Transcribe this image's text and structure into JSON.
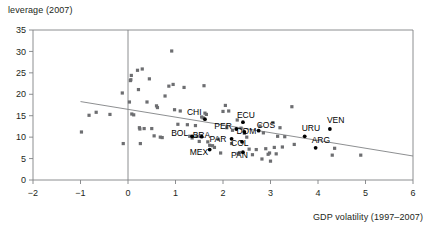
{
  "axes": {
    "ylabel": "leverage (2007)",
    "xlabel": "GDP volatility (1997–2007)",
    "yticks": [
      "0",
      "5",
      "10",
      "15",
      "20",
      "25",
      "30",
      "35"
    ],
    "xticks": [
      "−2",
      "−1",
      "0",
      "1",
      "2",
      "3",
      "4",
      "5",
      "6"
    ]
  },
  "colors": {
    "marker": "#6d6e71",
    "highlight": "#000000",
    "axis": "#808285",
    "trend": "#808285",
    "text": "#231f20",
    "background": "#ffffff"
  },
  "chart_data": {
    "type": "scatter",
    "title": "",
    "xlabel": "GDP volatility (1997–2007)",
    "ylabel": "leverage (2007)",
    "xlim": [
      -2,
      6
    ],
    "ylim": [
      0,
      35
    ],
    "xticks": [
      -2,
      -1,
      0,
      1,
      2,
      3,
      4,
      5,
      6
    ],
    "yticks": [
      0,
      5,
      10,
      15,
      20,
      25,
      30,
      35
    ],
    "grid": false,
    "legend": null,
    "reference_line": {
      "type": "vertical",
      "x": 0
    },
    "trend_line": {
      "x0": -1.0,
      "y0": 18.3,
      "x1": 6.0,
      "y1": 5.6
    },
    "series": [
      {
        "name": "countries (unlabeled)",
        "marker": "square",
        "color": "#6d6e71",
        "points": [
          [
            -0.98,
            11.2
          ],
          [
            -0.82,
            15.1
          ],
          [
            -0.67,
            15.8
          ],
          [
            -0.38,
            15.3
          ],
          [
            -0.12,
            20.3
          ],
          [
            -0.1,
            8.5
          ],
          [
            0.03,
            18.2
          ],
          [
            0.05,
            23.2
          ],
          [
            0.06,
            23.4
          ],
          [
            0.07,
            24.4
          ],
          [
            0.08,
            15.4
          ],
          [
            0.12,
            15.2
          ],
          [
            0.2,
            25.6
          ],
          [
            0.22,
            21.1
          ],
          [
            0.24,
            12.2
          ],
          [
            0.25,
            11.9
          ],
          [
            0.26,
            8.5
          ],
          [
            0.3,
            25.9
          ],
          [
            0.34,
            12.0
          ],
          [
            0.4,
            18.2
          ],
          [
            0.45,
            23.6
          ],
          [
            0.5,
            12.0
          ],
          [
            0.55,
            10.3
          ],
          [
            0.6,
            17.3
          ],
          [
            0.62,
            16.9
          ],
          [
            0.68,
            10.0
          ],
          [
            0.72,
            9.9
          ],
          [
            0.78,
            19.6
          ],
          [
            0.86,
            21.9
          ],
          [
            0.92,
            30.1
          ],
          [
            0.95,
            22.3
          ],
          [
            0.98,
            16.4
          ],
          [
            1.05,
            13.0
          ],
          [
            1.1,
            16.1
          ],
          [
            1.18,
            21.6
          ],
          [
            1.25,
            12.9
          ],
          [
            1.3,
            10.2
          ],
          [
            1.35,
            9.8
          ],
          [
            1.42,
            12.7
          ],
          [
            1.45,
            10.2
          ],
          [
            1.5,
            9.0
          ],
          [
            1.55,
            14.7
          ],
          [
            1.58,
            14.5
          ],
          [
            1.6,
            22.0
          ],
          [
            1.62,
            15.6
          ],
          [
            1.65,
            15.3
          ],
          [
            1.68,
            8.9
          ],
          [
            1.72,
            8.1
          ],
          [
            1.78,
            8.0
          ],
          [
            1.82,
            7.6
          ],
          [
            1.9,
            9.5
          ],
          [
            1.95,
            6.3
          ],
          [
            2.0,
            16.0
          ],
          [
            2.05,
            17.4
          ],
          [
            2.08,
            12.2
          ],
          [
            2.12,
            16.1
          ],
          [
            2.18,
            8.5
          ],
          [
            2.2,
            11.6
          ],
          [
            2.3,
            14.0
          ],
          [
            2.32,
            6.2
          ],
          [
            2.35,
            6.4
          ],
          [
            2.38,
            12.1
          ],
          [
            2.45,
            10.9
          ],
          [
            2.5,
            10.0
          ],
          [
            2.55,
            7.2
          ],
          [
            2.62,
            5.9
          ],
          [
            2.7,
            7.1
          ],
          [
            2.78,
            12.6
          ],
          [
            2.82,
            4.9
          ],
          [
            2.85,
            11.0
          ],
          [
            2.9,
            7.3
          ],
          [
            2.95,
            6.0
          ],
          [
            2.98,
            6.3
          ],
          [
            3.0,
            4.4
          ],
          [
            3.05,
            13.4
          ],
          [
            3.08,
            7.6
          ],
          [
            3.12,
            6.1
          ],
          [
            3.15,
            10.2
          ],
          [
            3.2,
            12.2
          ],
          [
            3.25,
            7.7
          ],
          [
            3.3,
            10.1
          ],
          [
            3.45,
            17.1
          ],
          [
            3.5,
            8.3
          ],
          [
            4.3,
            5.8
          ],
          [
            4.35,
            7.4
          ],
          [
            4.9,
            5.8
          ]
        ]
      },
      {
        "name": "countries (labeled)",
        "marker": "circle",
        "color": "#000000",
        "points": [
          {
            "label": "CHI",
            "x": 1.62,
            "y": 14.2,
            "label_dx": -18,
            "label_dy": -4
          },
          {
            "label": "BOL",
            "x": 1.35,
            "y": 10.2,
            "label_dx": -21,
            "label_dy": 0
          },
          {
            "label": "BRA",
            "x": 1.55,
            "y": 10.1,
            "label_dx": -9,
            "label_dy": 1
          },
          {
            "label": "MEX",
            "x": 1.72,
            "y": 7.1,
            "label_dx": -20,
            "label_dy": 5
          },
          {
            "label": "PER",
            "x": 2.28,
            "y": 11.9,
            "label_dx": -22,
            "label_dy": 0
          },
          {
            "label": "PAR",
            "x": 2.18,
            "y": 9.6,
            "label_dx": -22,
            "label_dy": 3
          },
          {
            "label": "ECU",
            "x": 2.42,
            "y": 13.5,
            "label_dx": -6,
            "label_dy": -4
          },
          {
            "label": "DOM",
            "x": 2.45,
            "y": 11.2,
            "label_dx": -8,
            "label_dy": 2
          },
          {
            "label": "COL",
            "x": 2.4,
            "y": 8.9,
            "label_dx": -11,
            "label_dy": 4
          },
          {
            "label": "PAN",
            "x": 2.42,
            "y": 6.5,
            "label_dx": -12,
            "label_dy": 6
          },
          {
            "label": "COS",
            "x": 2.75,
            "y": 11.5,
            "label_dx": -2,
            "label_dy": -3
          },
          {
            "label": "URU",
            "x": 3.72,
            "y": 10.2,
            "label_dx": -3,
            "label_dy": -5
          },
          {
            "label": "ARG",
            "x": 3.95,
            "y": 7.5,
            "label_dx": -4,
            "label_dy": -5
          },
          {
            "label": "VEN",
            "x": 4.25,
            "y": 11.9,
            "label_dx": -3,
            "label_dy": -6
          }
        ]
      }
    ]
  }
}
